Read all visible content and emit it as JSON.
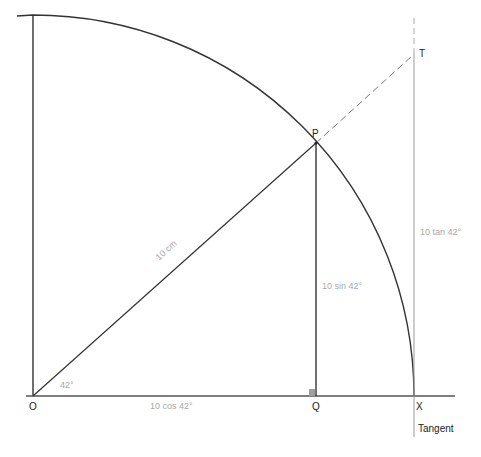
{
  "diagram": {
    "title": "",
    "points": {
      "origin": "O",
      "point_p": "P",
      "point_q": "Q",
      "point_x": "X",
      "point_t": "T"
    },
    "labels": {
      "radius": "10 cm",
      "angle": "42°",
      "adjacent": "10 cos 42°",
      "opposite": "10 sin 42°",
      "tangent_length": "10 tan 42°",
      "tangent_line": "Tangent"
    },
    "geometry": {
      "radius_cm": 10,
      "angle_deg": 42,
      "origin_px": [
        33,
        396
      ],
      "radius_px": 381
    },
    "colors": {
      "line": "#222222",
      "label": "#a8a8a8",
      "tangent": "#9a9a9a",
      "right_angle_marker": "#a0a0a0"
    }
  }
}
